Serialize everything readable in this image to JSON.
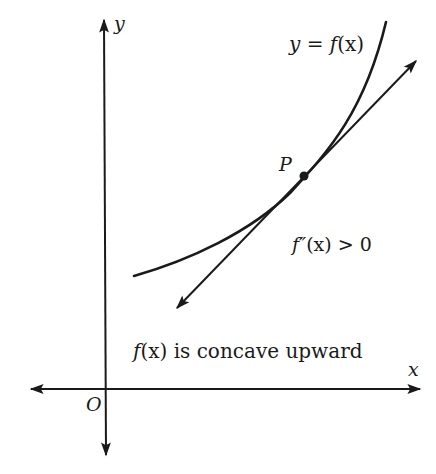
{
  "figure": {
    "axes": {
      "x_label": "x",
      "y_label": "y",
      "origin_label": "O"
    },
    "curve": {
      "label": "y = f(x)",
      "label_parts": {
        "lhs": "y",
        "eq": " = ",
        "fn": "f",
        "arg": "(x)"
      }
    },
    "tangent_point": {
      "label": "P"
    },
    "condition": {
      "text": "f″(x) > 0",
      "parts": {
        "fn": "f″",
        "arg": "(x)",
        "rel": " > 0"
      }
    },
    "caption": {
      "text": "f(x) is concave upward",
      "parts": {
        "fn": "f",
        "arg": "(x)",
        "rest": " is concave upward"
      }
    },
    "colors": {
      "ink": "#1a1a1a",
      "background": "#ffffff"
    }
  }
}
